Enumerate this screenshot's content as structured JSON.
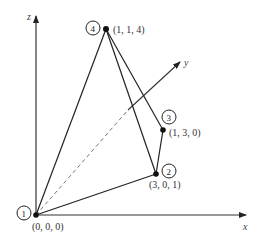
{
  "diagram": {
    "type": "3d-coordinate-tetrahedron",
    "axes": {
      "x": {
        "label": "x"
      },
      "y": {
        "label": "y"
      },
      "z": {
        "label": "z"
      }
    },
    "nodes": [
      {
        "id": "1",
        "number": "1",
        "coords": "(0, 0, 0)"
      },
      {
        "id": "2",
        "number": "2",
        "coords": "(3, 0, 1)"
      },
      {
        "id": "3",
        "number": "3",
        "coords": "(1, 3, 0)"
      },
      {
        "id": "4",
        "number": "4",
        "coords": "(1, 1, 4)"
      }
    ],
    "edges": [
      {
        "from": "1",
        "to": "4"
      },
      {
        "from": "1",
        "to": "2"
      },
      {
        "from": "4",
        "to": "2"
      },
      {
        "from": "4",
        "to": "3"
      },
      {
        "from": "3",
        "to": "2"
      },
      {
        "from": "1",
        "to": "3",
        "style": "dashed"
      }
    ],
    "colors": {
      "line": "#222222",
      "background": "#ffffff"
    }
  }
}
